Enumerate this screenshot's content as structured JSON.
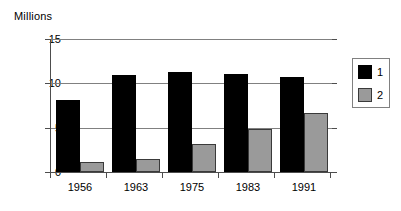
{
  "chart_data": {
    "type": "bar",
    "title": "Millions",
    "xlabel": "",
    "ylabel": "Millions",
    "categories": [
      "1956",
      "1963",
      "1975",
      "1983",
      "1991"
    ],
    "series": [
      {
        "name": "1",
        "color": "#000000",
        "values": [
          8.1,
          10.9,
          11.3,
          11.1,
          10.7
        ]
      },
      {
        "name": "2",
        "color": "#9a9a9a",
        "values": [
          1.1,
          1.5,
          3.2,
          4.9,
          6.7
        ]
      }
    ],
    "ylim": [
      0,
      15
    ],
    "yticks": [
      "0",
      "5",
      "10",
      "15"
    ],
    "ytick_values": [
      0,
      5,
      10,
      15
    ],
    "grid": true,
    "legend_position": "right"
  }
}
